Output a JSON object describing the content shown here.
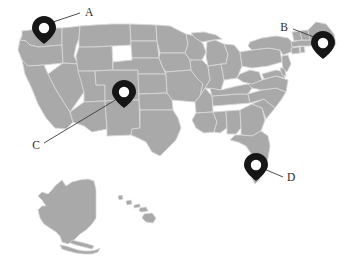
{
  "figure": {
    "type": "annotated-map",
    "region": "United States",
    "background_color": "#ffffff",
    "land_fill_color": "#a9a9a9",
    "border_color": "#d6d6d6",
    "marker_color": "#161616",
    "label_color": "#2b2b2b",
    "leader_color": "#3b3b3b",
    "width": 348,
    "height": 260
  },
  "markers": [
    {
      "label": "A",
      "pin_x": 44,
      "pin_tip_y": 44,
      "circle_cx": 44,
      "circle_cy": 28,
      "label_x": 88,
      "label_y": 13,
      "leader_from_x": 53,
      "leader_from_y": 22,
      "leader_to_x": 80,
      "leader_to_y": 13,
      "area": "Pacific Northwest"
    },
    {
      "label": "B",
      "pin_x": 323,
      "pin_tip_y": 59,
      "circle_cx": 323,
      "circle_cy": 43,
      "label_x": 285,
      "label_y": 28,
      "leader_from_x": 314,
      "leader_from_y": 37,
      "leader_to_x": 293,
      "leader_to_y": 29,
      "area": "Northeast"
    },
    {
      "label": "C",
      "pin_x": 124,
      "pin_tip_y": 108,
      "circle_cx": 124,
      "circle_cy": 92,
      "label_x": 37,
      "label_y": 146,
      "leader_from_x": 117,
      "leader_from_y": 99,
      "leader_to_x": 44,
      "leader_to_y": 143,
      "area": "Mountain West"
    },
    {
      "label": "D",
      "pin_x": 256,
      "pin_tip_y": 181,
      "circle_cx": 256,
      "circle_cy": 165,
      "label_x": 290,
      "label_y": 178,
      "leader_from_x": 264,
      "leader_from_y": 169,
      "leader_to_x": 283,
      "leader_to_y": 177,
      "area": "Southeast"
    }
  ],
  "insets": [
    {
      "name": "alaska"
    },
    {
      "name": "hawaii"
    }
  ]
}
